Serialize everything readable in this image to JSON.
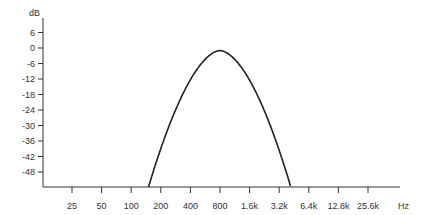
{
  "chart_data": {
    "type": "line",
    "title": "",
    "xlabel": "Hz",
    "ylabel": "dB",
    "x_scale": "log2",
    "x_ticks": [
      "25",
      "50",
      "100",
      "200",
      "400",
      "800",
      "1.6k",
      "3.2k",
      "6.4k",
      "12.8k",
      "25.6k"
    ],
    "x_tick_values": [
      25,
      50,
      100,
      200,
      400,
      800,
      1600,
      3200,
      6400,
      12800,
      25600
    ],
    "y_ticks": [
      "6",
      "0",
      "-6",
      "-12",
      "-18",
      "-24",
      "-30",
      "-36",
      "-42",
      "-48"
    ],
    "y_tick_values": [
      6,
      0,
      -6,
      -12,
      -18,
      -24,
      -30,
      -36,
      -42,
      -48
    ],
    "ylim": [
      -53,
      9
    ],
    "grid": false,
    "legend": null,
    "series": [
      {
        "name": "band-pass response",
        "x": [
          150,
          200,
          300,
          400,
          600,
          800,
          1000,
          1600,
          2400,
          3200,
          4200
        ],
        "y": [
          -53,
          -40,
          -24,
          -14,
          -5,
          -1,
          -3,
          -12,
          -28,
          -40,
          -53
        ]
      }
    ],
    "peak": {
      "x": 800,
      "y": -1
    }
  }
}
